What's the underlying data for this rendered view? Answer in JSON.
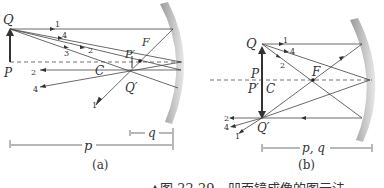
{
  "panel_a": {
    "caption": "(a)",
    "labels": {
      "Q": "Q",
      "P": "P",
      "P_prime": "P′",
      "F": "F",
      "C": "C",
      "Q_prime": "Q′",
      "p": "p",
      "q": "q"
    },
    "ray_labels": [
      "1",
      "4",
      "3",
      "2",
      "2",
      "4",
      "1"
    ]
  },
  "panel_b": {
    "caption": "(b)",
    "labels": {
      "Q": "Q",
      "P": "P",
      "P_prime": "P′",
      "C": "C",
      "F": "F",
      "Q_prime": "Q′",
      "pq": "p, q"
    },
    "ray_labels": [
      "1",
      "4",
      "2",
      "2",
      "4",
      "1"
    ]
  },
  "figure_caption": "▲图 22-29　凹面镜成像的图示法"
}
